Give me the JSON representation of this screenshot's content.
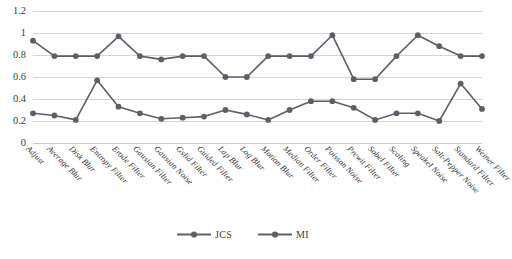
{
  "chart_data": {
    "type": "line",
    "title": "",
    "xlabel": "",
    "ylabel": "",
    "ylim": [
      0,
      1.2
    ],
    "yticks": [
      "0",
      "0.2",
      "0.4",
      "0.6",
      "0.8",
      "1",
      "1.2"
    ],
    "ytick_values": [
      0,
      0.2,
      0.4,
      0.6,
      0.8,
      1,
      1.2
    ],
    "grid": true,
    "legend_position": "bottom",
    "categories": [
      "Adjust",
      "Average Blur",
      "Disk Blur",
      "Entropy Filter",
      "Erode Filter",
      "Gausian Filter",
      "Gausian Noise",
      "Gslid Filter",
      "Guided Filter",
      "Lap Blur",
      "Log Blur",
      "Motion Blur",
      "Median Filter",
      "Order Filter",
      "Poisson Noise",
      "Prewit Filter",
      "Sobel Filter",
      "Scaling",
      "Speakel Noise",
      "Salt-Pepper Noise",
      "Standard Filter",
      "Weiner Filter"
    ],
    "series": [
      {
        "name": "JCS",
        "color": "#5b6068",
        "values": [
          0.93,
          0.79,
          0.79,
          0.79,
          0.97,
          0.79,
          0.76,
          0.79,
          0.79,
          0.6,
          0.6,
          0.79,
          0.79,
          0.79,
          0.98,
          0.58,
          0.58,
          0.79,
          0.98,
          0.88,
          0.79,
          0.79
        ]
      },
      {
        "name": "MI",
        "color": "#5b6068",
        "values": [
          0.27,
          0.25,
          0.21,
          0.57,
          0.33,
          0.27,
          0.22,
          0.23,
          0.24,
          0.3,
          0.26,
          0.21,
          0.3,
          0.38,
          0.38,
          0.32,
          0.21,
          0.27,
          0.27,
          0.2,
          0.54,
          0.31
        ]
      }
    ]
  },
  "legend": {
    "entries": [
      {
        "label": "JCS"
      },
      {
        "label": "MI"
      }
    ]
  }
}
